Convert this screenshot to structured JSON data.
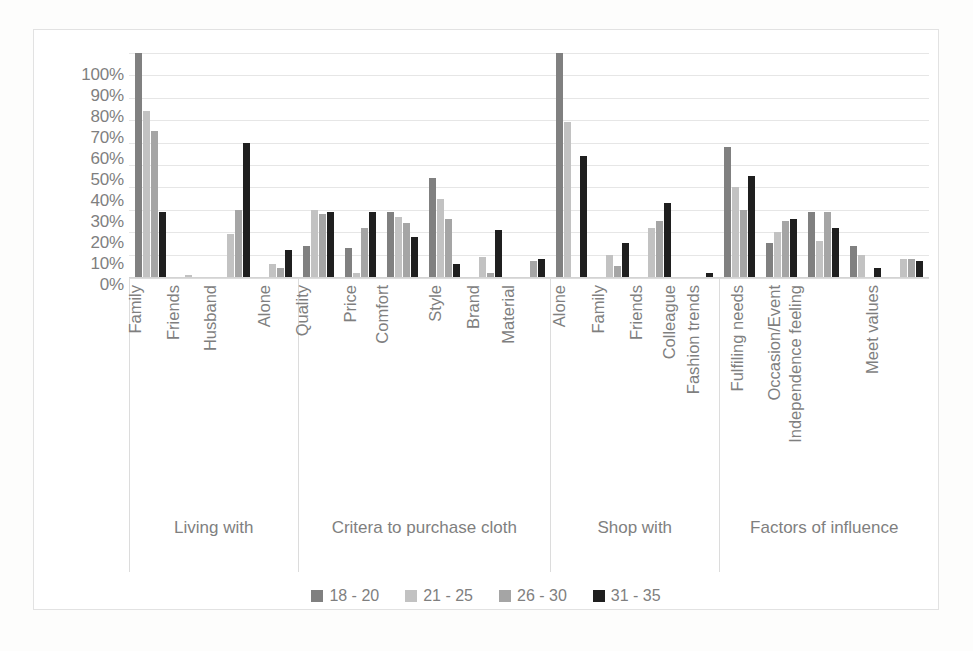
{
  "chart_data": {
    "type": "bar",
    "title": "",
    "xlabel": "",
    "ylabel": "",
    "ylim": [
      0,
      1.0
    ],
    "grid": true,
    "legend_position": "bottom",
    "y_ticks": [
      "100%",
      "90%",
      "80%",
      "70%",
      "60%",
      "50%",
      "40%",
      "30%",
      "20%",
      "10%",
      "0%"
    ],
    "y_tick_values": [
      100,
      90,
      80,
      70,
      60,
      50,
      40,
      30,
      20,
      10,
      0
    ],
    "series": [
      {
        "name": "18 - 20",
        "color": "#808080"
      },
      {
        "name": "21 - 25",
        "color": "#c2c2c2"
      },
      {
        "name": "26 - 30",
        "color": "#a5a5a5"
      },
      {
        "name": "31 - 35",
        "color": "#1f1f1f"
      }
    ],
    "groups": [
      {
        "label": "Living with",
        "categories": [
          "Family",
          "Friends",
          "Husband",
          "Alone"
        ],
        "values": [
          [
            100,
            74,
            65,
            29
          ],
          [
            0,
            1,
            0,
            0
          ],
          [
            0,
            19,
            30,
            60
          ],
          [
            0,
            6,
            4,
            12
          ]
        ]
      },
      {
        "label": "Critera to purchase cloth",
        "categories": [
          "Quality",
          "Price",
          "Comfort",
          "Style",
          "Brand",
          "Material"
        ],
        "values": [
          [
            14,
            30,
            28,
            29
          ],
          [
            13,
            2,
            22,
            29
          ],
          [
            29,
            27,
            24,
            18
          ],
          [
            44,
            35,
            26,
            6
          ],
          [
            0,
            9,
            2,
            21
          ],
          [
            0,
            0,
            7,
            8
          ]
        ]
      },
      {
        "label": "Shop with",
        "categories": [
          "Alone",
          "Family",
          "Friends",
          "Colleague"
        ],
        "values": [
          [
            100,
            69,
            0,
            54
          ],
          [
            0,
            10,
            5,
            15
          ],
          [
            0,
            22,
            25,
            33
          ],
          [
            0,
            0,
            0,
            2
          ]
        ]
      },
      {
        "label": "Factors of influence",
        "categories": [
          "Fashion trends",
          "Fulfiling needs",
          "Occasion/Event",
          "Independence feeling",
          "Meet values"
        ],
        "values": [
          [
            58,
            40,
            30,
            45
          ],
          [
            15,
            20,
            25,
            26
          ],
          [
            29,
            16,
            29,
            22
          ],
          [
            14,
            10,
            0,
            4
          ],
          [
            0,
            8,
            8,
            7
          ]
        ]
      }
    ]
  },
  "legend": {
    "items": [
      {
        "label": "18 - 20",
        "color": "#808080"
      },
      {
        "label": "21 - 25",
        "color": "#c2c2c2"
      },
      {
        "label": "26 - 30",
        "color": "#a5a5a5"
      },
      {
        "label": "31 - 35",
        "color": "#1f1f1f"
      }
    ]
  }
}
